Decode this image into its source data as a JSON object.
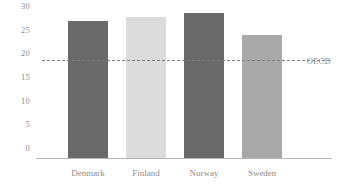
{
  "chart_data": {
    "type": "bar",
    "title": "",
    "subtitle": "",
    "xlabel": "",
    "ylabel": "",
    "categories": [
      "Denmark",
      "Finland",
      "Norway",
      "Sweden"
    ],
    "values": [
      29,
      29.7,
      30.5,
      26
    ],
    "bar_colors": [
      "#696969",
      "#dcdcdc",
      "#696969",
      "#a9a9a9"
    ],
    "ylim": [
      0,
      30.8
    ],
    "yticks": [
      30,
      25,
      20,
      15,
      10,
      5,
      0
    ],
    "ytick_labels": [
      "30",
      "25",
      "20",
      "15",
      "10",
      "5",
      "0"
    ],
    "grid": false,
    "legend": null,
    "annotations": [
      {
        "name": "oecd-reference-line",
        "label": "OECD",
        "value": 20.5,
        "style": "dashed",
        "color": "#7d7d7d"
      }
    ],
    "axis_color": "#b5b5b5",
    "text_color": "#8c8c8c",
    "background": "#ffffff"
  }
}
